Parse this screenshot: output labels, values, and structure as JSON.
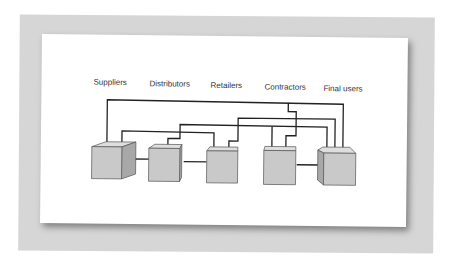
{
  "diagram": {
    "type": "network",
    "nodes": [
      {
        "id": "suppliers",
        "label": "Suppliers"
      },
      {
        "id": "distributors",
        "label": "Distributors"
      },
      {
        "id": "retailers",
        "label": "Retailers"
      },
      {
        "id": "contractors",
        "label": "Contractors"
      },
      {
        "id": "final_users",
        "label": "Final users"
      }
    ],
    "edges": [
      {
        "from": "suppliers",
        "to": "distributors"
      },
      {
        "from": "distributors",
        "to": "retailers"
      },
      {
        "from": "contractors",
        "to": "final_users"
      },
      {
        "from": "suppliers",
        "to": "final_users"
      },
      {
        "from": "suppliers",
        "to": "retailers"
      },
      {
        "from": "distributors",
        "to": "final_users"
      },
      {
        "from": "retailers",
        "to": "final_users"
      },
      {
        "from": "contractors",
        "to": "distributors"
      },
      {
        "from": "contractors",
        "to": "suppliers"
      }
    ],
    "colors": {
      "backdrop": "#d6d6d6",
      "card": "#ffffff",
      "cube_front": "#c9c9c9",
      "cube_top": "#dedede",
      "cube_side": "#a8a8a8",
      "line": "#222222",
      "text": "#333333"
    }
  }
}
